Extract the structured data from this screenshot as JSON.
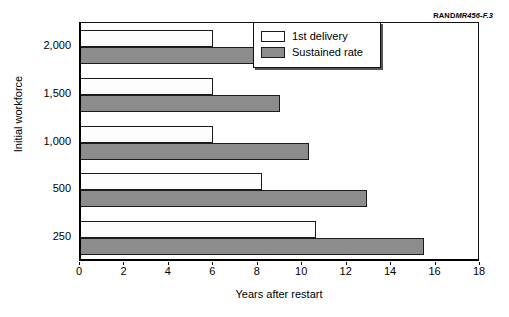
{
  "source_credit": {
    "rand": "RAND",
    "doc_id": "MR456-F.3"
  },
  "legend": {
    "position": "top-right",
    "entries": [
      {
        "label": "1st delivery",
        "color": "#ffffff"
      },
      {
        "label": "Sustained rate",
        "color": "#8c8c8c"
      }
    ]
  },
  "chart_data": {
    "type": "bar",
    "orientation": "horizontal",
    "title": "",
    "xlabel": "Years after restart",
    "ylabel": "Initial workforce",
    "categories": [
      "2,000",
      "1,500",
      "1,000",
      "500",
      "250"
    ],
    "series": [
      {
        "name": "1st delivery",
        "color": "#ffffff",
        "values": [
          6.0,
          6.0,
          6.0,
          8.2,
          10.6
        ]
      },
      {
        "name": "Sustained rate",
        "color": "#8c8c8c",
        "values": [
          8.2,
          9.0,
          10.3,
          12.9,
          15.5
        ]
      }
    ],
    "xlim": [
      0,
      18
    ],
    "xticks": [
      0,
      2,
      4,
      6,
      8,
      10,
      12,
      14,
      16,
      18
    ],
    "xtick_labels": [
      "0",
      "2",
      "4",
      "6",
      "8",
      "10",
      "12",
      "14",
      "16",
      "18"
    ],
    "grid": false,
    "legend_position": "top-right"
  }
}
